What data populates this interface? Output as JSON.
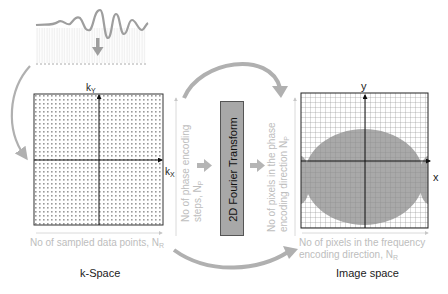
{
  "diagram": {
    "title_left": "k-Space",
    "title_right": "Image space",
    "transform_label": "2D Fourier Transform",
    "kspace": {
      "axis_x": "k",
      "axis_x_sub": "X",
      "axis_y": "k",
      "axis_y_sub": "Y",
      "bottom_label": "No of sampled data points, N",
      "bottom_label_sub": "R",
      "side_label_line1": "No of phase encoding",
      "side_label_line2": "steps, N",
      "side_label_sub": "P"
    },
    "image_space": {
      "axis_x": "x",
      "axis_y": "y",
      "side_label_line1": "No of pixels in the phase",
      "side_label_line2": "encoding direction N",
      "side_label_sub": "P",
      "bottom_label_line1": "No of pixels in the frequency",
      "bottom_label_line2": "encoding direction, N",
      "bottom_label_sub": "R"
    },
    "colors": {
      "arrow_grey": "#b0b0b0",
      "label_grey": "#bdbdbd",
      "grid_line": "#777777",
      "object_fill": "#a9a9a9",
      "ft_box_fill": "#a8a8a8",
      "axis_dark": "#111111"
    }
  }
}
